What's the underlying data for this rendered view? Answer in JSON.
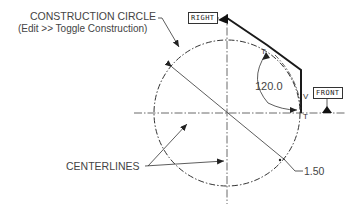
{
  "diagram": {
    "labels": {
      "construction_circle": "CONSTRUCTION CIRCLE",
      "construction_hint": "(Edit >> Toggle Construction)",
      "centerlines": "CENTERLINES",
      "diameter": "1.50",
      "angle": "120.0",
      "constraint_tangent": "T",
      "constraint_vertical": "V"
    },
    "view_labels": {
      "right": "RIGHT",
      "front": "FRONT"
    },
    "geometry": {
      "circle_center": [
        227,
        113
      ],
      "circle_radius": 73,
      "line_color": "#2a2a2a",
      "sketch_line_color": "#1a1a1a"
    }
  }
}
